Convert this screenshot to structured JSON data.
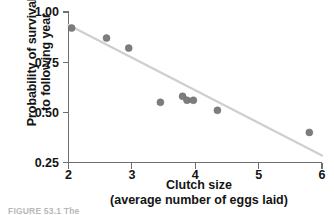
{
  "figure": {
    "caption_fragment": "FIGURE 53.1  The"
  },
  "axes": {
    "y_title_line1": "Probability of survival",
    "y_title_line2": "to following year",
    "x_title_line1": "Clutch size",
    "x_title_line2": "(average number of eggs laid)"
  },
  "colors": {
    "point": "#7d7d7d",
    "trend_line": "#cfcfcf",
    "axis": "#6e6e6e",
    "text": "#141414",
    "background": "#ffffff"
  },
  "chart_data": {
    "type": "scatter",
    "title": "",
    "subtitle": "",
    "xlabel": "Clutch size (average number of eggs laid)",
    "ylabel": "Probability of survival to following year",
    "xlim": [
      2,
      6
    ],
    "ylim": [
      0.25,
      1.0
    ],
    "grid": false,
    "legend": "none",
    "xticks": [
      2,
      3,
      4,
      5,
      6
    ],
    "xtick_labels": [
      "2",
      "3",
      "4",
      "5",
      "6"
    ],
    "yticks": [
      0.25,
      0.5,
      0.75,
      1.0
    ],
    "ytick_labels": [
      "0.25",
      "0.50",
      "0.75",
      "1.00"
    ],
    "series": [
      {
        "name": "Observed broods",
        "type": "scatter",
        "marker": "circle",
        "color": "#7d7d7d",
        "points": [
          {
            "x": 2.05,
            "y": 0.92
          },
          {
            "x": 2.6,
            "y": 0.87
          },
          {
            "x": 2.95,
            "y": 0.82
          },
          {
            "x": 3.45,
            "y": 0.55
          },
          {
            "x": 3.8,
            "y": 0.58
          },
          {
            "x": 3.87,
            "y": 0.56
          },
          {
            "x": 3.97,
            "y": 0.56
          },
          {
            "x": 4.35,
            "y": 0.51
          },
          {
            "x": 5.8,
            "y": 0.4
          }
        ]
      },
      {
        "name": "Fitted trend line",
        "type": "line",
        "color": "#cfcfcf",
        "points": [
          {
            "x": 2.0,
            "y": 0.935
          },
          {
            "x": 6.0,
            "y": 0.285
          }
        ]
      }
    ]
  }
}
